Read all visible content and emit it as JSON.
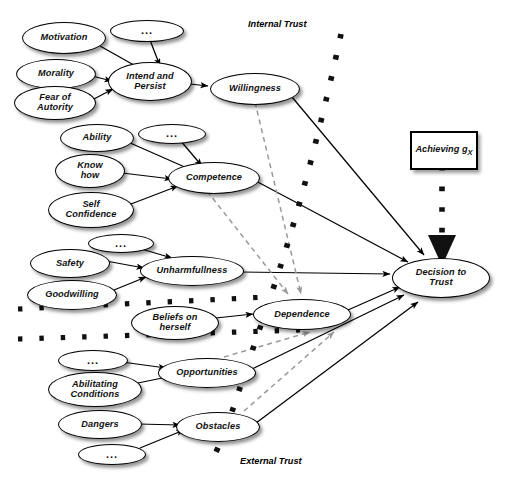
{
  "figure": {
    "captions": [
      {
        "id": "internal-trust",
        "text": "Internal Trust",
        "x": 248,
        "y": 19
      },
      {
        "id": "external-trust",
        "text": "External Trust",
        "x": 240,
        "y": 456
      }
    ],
    "colors": {
      "node_stroke": "#000000",
      "node_fill": "#ffffff",
      "solid_edge": "#000000",
      "dashed_edge": "#9a9a9a",
      "boundary_dots": "#111111",
      "text": "#111111"
    }
  },
  "nodes": [
    {
      "id": "motivation",
      "label": "Motivation",
      "shape": "ellipse",
      "x": 22,
      "y": 22,
      "w": 82,
      "h": 30,
      "font": "f9",
      "group": "willingness-inputs"
    },
    {
      "id": "dots-willingness",
      "label": "...",
      "shape": "ellipse",
      "x": 110,
      "y": 20,
      "w": 72,
      "h": 20,
      "font": "dots",
      "group": "willingness-inputs"
    },
    {
      "id": "morality",
      "label": "Morality",
      "shape": "ellipse",
      "x": 16,
      "y": 59,
      "w": 78,
      "h": 28,
      "font": "f9",
      "group": "willingness-inputs"
    },
    {
      "id": "fear-of-autority",
      "label": "Fear of\nAutority",
      "shape": "ellipse",
      "x": 14,
      "y": 86,
      "w": 80,
      "h": 32,
      "font": "f9",
      "group": "willingness-inputs"
    },
    {
      "id": "intend-and-persist",
      "label": "Intend and\nPersist",
      "shape": "ellipse",
      "x": 108,
      "y": 62,
      "w": 82,
      "h": 37,
      "font": "f9",
      "group": "willingness-core"
    },
    {
      "id": "willingness",
      "label": "Willingness",
      "shape": "ellipse",
      "x": 210,
      "y": 73,
      "w": 88,
      "h": 30,
      "font": "f9",
      "group": "willingness-core"
    },
    {
      "id": "ability",
      "label": "Ability",
      "shape": "ellipse",
      "x": 60,
      "y": 124,
      "w": 72,
      "h": 26,
      "font": "f9",
      "group": "competence-inputs"
    },
    {
      "id": "dots-competence",
      "label": "...",
      "shape": "ellipse",
      "x": 138,
      "y": 124,
      "w": 66,
      "h": 18,
      "font": "dots",
      "group": "competence-inputs"
    },
    {
      "id": "know-how",
      "label": "Know\nhow",
      "shape": "ellipse",
      "x": 55,
      "y": 154,
      "w": 68,
      "h": 32,
      "font": "f9",
      "group": "competence-inputs"
    },
    {
      "id": "self-confidence",
      "label": "Self\nConfidence",
      "shape": "ellipse",
      "x": 48,
      "y": 192,
      "w": 84,
      "h": 34,
      "font": "f9",
      "group": "competence-inputs"
    },
    {
      "id": "competence",
      "label": "Competence",
      "shape": "ellipse",
      "x": 168,
      "y": 162,
      "w": 90,
      "h": 30,
      "font": "f9",
      "group": "competence-core"
    },
    {
      "id": "dots-unharm",
      "label": "...",
      "shape": "ellipse",
      "x": 88,
      "y": 234,
      "w": 64,
      "h": 17,
      "font": "dots",
      "group": "unharm-inputs"
    },
    {
      "id": "safety",
      "label": "Safety",
      "shape": "ellipse",
      "x": 30,
      "y": 249,
      "w": 78,
      "h": 27,
      "font": "f9",
      "group": "unharm-inputs"
    },
    {
      "id": "goodwilling",
      "label": "Goodwilling",
      "shape": "ellipse",
      "x": 27,
      "y": 280,
      "w": 88,
      "h": 28,
      "font": "f9",
      "group": "unharm-inputs"
    },
    {
      "id": "unharmfullness",
      "label": "Unharmfullness",
      "shape": "ellipse",
      "x": 140,
      "y": 256,
      "w": 102,
      "h": 28,
      "font": "f9",
      "group": "unharm-core"
    },
    {
      "id": "beliefs-on-herself",
      "label": "Beliefs on\nherself",
      "shape": "ellipse",
      "x": 131,
      "y": 306,
      "w": 86,
      "h": 32,
      "font": "f9",
      "group": "dependence-inputs"
    },
    {
      "id": "dependence",
      "label": "Dependence",
      "shape": "ellipse",
      "x": 253,
      "y": 299,
      "w": 96,
      "h": 29,
      "font": "f9",
      "group": "dependence-core"
    },
    {
      "id": "dots-opportunities",
      "label": "...",
      "shape": "ellipse",
      "x": 58,
      "y": 350,
      "w": 68,
      "h": 19,
      "font": "dots",
      "group": "external-inputs"
    },
    {
      "id": "abilitating-conditions",
      "label": "Abilitating\nConditions",
      "shape": "ellipse",
      "x": 48,
      "y": 372,
      "w": 92,
      "h": 33,
      "font": "f9",
      "group": "external-inputs"
    },
    {
      "id": "opportunities",
      "label": "Opportunities",
      "shape": "ellipse",
      "x": 158,
      "y": 358,
      "w": 96,
      "h": 28,
      "font": "f9",
      "group": "external-core"
    },
    {
      "id": "dangers",
      "label": "Dangers",
      "shape": "ellipse",
      "x": 58,
      "y": 410,
      "w": 82,
      "h": 27,
      "font": "f9",
      "group": "external-inputs"
    },
    {
      "id": "dots-obstacles",
      "label": "...",
      "shape": "ellipse",
      "x": 78,
      "y": 444,
      "w": 66,
      "h": 19,
      "font": "dots",
      "group": "external-inputs"
    },
    {
      "id": "obstacles",
      "label": "Obstacles",
      "shape": "ellipse",
      "x": 176,
      "y": 412,
      "w": 82,
      "h": 28,
      "font": "f9",
      "group": "external-core"
    },
    {
      "id": "decision-to-trust",
      "label": "Decision to\nTrust",
      "shape": "ellipse",
      "x": 392,
      "y": 258,
      "w": 96,
      "h": 38,
      "font": "f9",
      "group": "outcome"
    },
    {
      "id": "achieving-gx",
      "label": "Achieving g",
      "sublabel": "X",
      "shape": "rect",
      "x": 410,
      "y": 131,
      "w": 64,
      "h": 35,
      "font": "f9",
      "group": "goal"
    }
  ],
  "edges": [
    {
      "from": "motivation",
      "to": "intend-and-persist",
      "style": "solid"
    },
    {
      "from": "dots-willingness",
      "to": "intend-and-persist",
      "style": "solid"
    },
    {
      "from": "morality",
      "to": "intend-and-persist",
      "style": "solid"
    },
    {
      "from": "fear-of-autority",
      "to": "intend-and-persist",
      "style": "solid"
    },
    {
      "from": "intend-and-persist",
      "to": "willingness",
      "style": "solid"
    },
    {
      "from": "ability",
      "to": "competence",
      "style": "solid"
    },
    {
      "from": "dots-competence",
      "to": "competence",
      "style": "solid"
    },
    {
      "from": "know-how",
      "to": "competence",
      "style": "solid"
    },
    {
      "from": "self-confidence",
      "to": "competence",
      "style": "solid"
    },
    {
      "from": "dots-unharm",
      "to": "unharmfullness",
      "style": "solid"
    },
    {
      "from": "safety",
      "to": "unharmfullness",
      "style": "solid"
    },
    {
      "from": "goodwilling",
      "to": "unharmfullness",
      "style": "solid"
    },
    {
      "from": "beliefs-on-herself",
      "to": "dependence",
      "style": "solid"
    },
    {
      "from": "dots-opportunities",
      "to": "opportunities",
      "style": "solid"
    },
    {
      "from": "abilitating-conditions",
      "to": "opportunities",
      "style": "solid"
    },
    {
      "from": "dangers",
      "to": "obstacles",
      "style": "solid"
    },
    {
      "from": "dots-obstacles",
      "to": "obstacles",
      "style": "solid"
    },
    {
      "from": "willingness",
      "to": "decision-to-trust",
      "style": "solid"
    },
    {
      "from": "competence",
      "to": "decision-to-trust",
      "style": "solid"
    },
    {
      "from": "unharmfullness",
      "to": "decision-to-trust",
      "style": "solid"
    },
    {
      "from": "dependence",
      "to": "decision-to-trust",
      "style": "solid"
    },
    {
      "from": "opportunities",
      "to": "decision-to-trust",
      "style": "solid"
    },
    {
      "from": "obstacles",
      "to": "decision-to-trust",
      "style": "solid"
    },
    {
      "from": "achieving-gx",
      "to": "decision-to-trust",
      "style": "dotted-thick"
    },
    {
      "from": "willingness",
      "to": "dependence",
      "style": "dashed-gray"
    },
    {
      "from": "competence",
      "to": "dependence",
      "style": "dashed-gray"
    },
    {
      "from": "opportunities",
      "to": "dependence",
      "style": "dashed-gray"
    },
    {
      "from": "obstacles",
      "to": "dependence",
      "style": "dashed-gray"
    }
  ]
}
